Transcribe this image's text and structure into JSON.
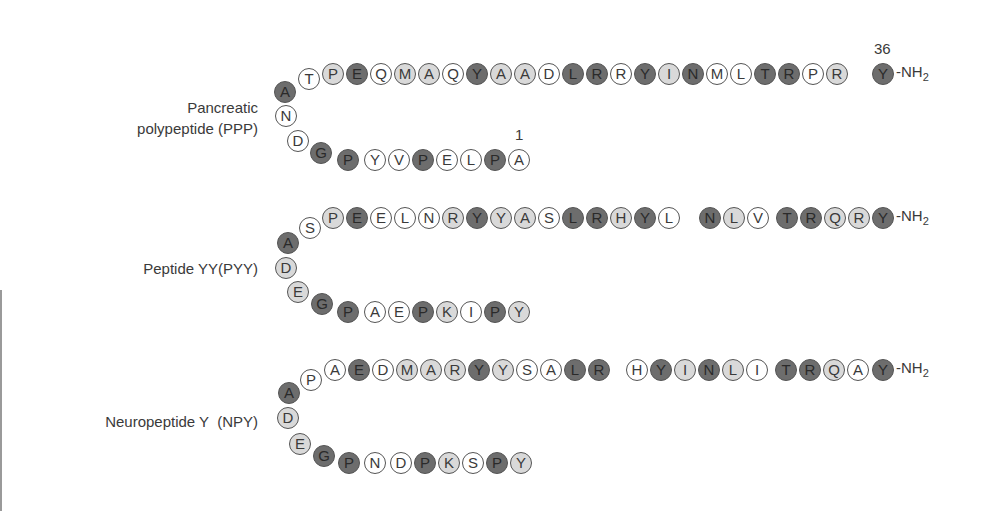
{
  "colors": {
    "dark": "#6d6d6d",
    "light": "#d9d9d9",
    "white": "#ffffff",
    "outline": "#555555"
  },
  "terminal_label": "-NH",
  "terminal_sub": "2",
  "peptides": [
    {
      "name": "Pancreatic polypeptide (PPP)",
      "label_lines": [
        "Pancreatic",
        "polypeptide (PPP)"
      ],
      "label_box": {
        "right": 258,
        "top": 97
      },
      "start_number": "1",
      "end_number": "36",
      "sequence_N_to_C": "APLEPVYPGDNATPEQMAQYAADLRRYINMLTRPRY",
      "residues": [
        {
          "aa": "A",
          "shade": "white",
          "x": 519,
          "y": 160
        },
        {
          "aa": "P",
          "shade": "dark",
          "x": 495,
          "y": 160
        },
        {
          "aa": "L",
          "shade": "white",
          "x": 471,
          "y": 160
        },
        {
          "aa": "E",
          "shade": "white",
          "x": 447,
          "y": 160
        },
        {
          "aa": "P",
          "shade": "dark",
          "x": 423,
          "y": 160
        },
        {
          "aa": "V",
          "shade": "white",
          "x": 399,
          "y": 160
        },
        {
          "aa": "Y",
          "shade": "white",
          "x": 375,
          "y": 160
        },
        {
          "aa": "P",
          "shade": "dark",
          "x": 348,
          "y": 160
        },
        {
          "aa": "G",
          "shade": "dark",
          "x": 321,
          "y": 153
        },
        {
          "aa": "D",
          "shade": "white",
          "x": 298,
          "y": 141
        },
        {
          "aa": "N",
          "shade": "white",
          "x": 286,
          "y": 116
        },
        {
          "aa": "A",
          "shade": "dark",
          "x": 285,
          "y": 92
        },
        {
          "aa": "T",
          "shade": "white",
          "x": 309,
          "y": 79
        },
        {
          "aa": "P",
          "shade": "light",
          "x": 333,
          "y": 74
        },
        {
          "aa": "E",
          "shade": "dark",
          "x": 357,
          "y": 74
        },
        {
          "aa": "Q",
          "shade": "white",
          "x": 381,
          "y": 74
        },
        {
          "aa": "M",
          "shade": "light",
          "x": 405,
          "y": 74
        },
        {
          "aa": "A",
          "shade": "light",
          "x": 429,
          "y": 74
        },
        {
          "aa": "Q",
          "shade": "white",
          "x": 453,
          "y": 74
        },
        {
          "aa": "Y",
          "shade": "dark",
          "x": 477,
          "y": 74
        },
        {
          "aa": "A",
          "shade": "light",
          "x": 501,
          "y": 74
        },
        {
          "aa": "A",
          "shade": "light",
          "x": 525,
          "y": 74
        },
        {
          "aa": "D",
          "shade": "white",
          "x": 549,
          "y": 74
        },
        {
          "aa": "L",
          "shade": "dark",
          "x": 573,
          "y": 74
        },
        {
          "aa": "R",
          "shade": "dark",
          "x": 597,
          "y": 74
        },
        {
          "aa": "R",
          "shade": "white",
          "x": 621,
          "y": 74
        },
        {
          "aa": "Y",
          "shade": "dark",
          "x": 645,
          "y": 74
        },
        {
          "aa": "I",
          "shade": "light",
          "x": 669,
          "y": 74
        },
        {
          "aa": "N",
          "shade": "dark",
          "x": 693,
          "y": 74
        },
        {
          "aa": "M",
          "shade": "white",
          "x": 717,
          "y": 74
        },
        {
          "aa": "L",
          "shade": "white",
          "x": 741,
          "y": 74
        },
        {
          "aa": "T",
          "shade": "dark",
          "x": 765,
          "y": 74
        },
        {
          "aa": "R",
          "shade": "dark",
          "x": 789,
          "y": 74
        },
        {
          "aa": "P",
          "shade": "white",
          "x": 813,
          "y": 74
        },
        {
          "aa": "R",
          "shade": "light",
          "x": 837,
          "y": 74
        },
        {
          "aa": "Y",
          "shade": "dark",
          "x": 883,
          "y": 74
        }
      ]
    },
    {
      "name": "Peptide YY(PYY)",
      "label_lines": [
        "Peptide YY(PYY)"
      ],
      "label_box": {
        "right": 258,
        "top": 258
      },
      "sequence_N_to_C": "YPIKPEAPGEDASPEELNRYYASLRHYLNLVTRQRY",
      "residues": [
        {
          "aa": "Y",
          "shade": "light",
          "x": 519,
          "y": 312
        },
        {
          "aa": "P",
          "shade": "dark",
          "x": 495,
          "y": 312
        },
        {
          "aa": "I",
          "shade": "white",
          "x": 471,
          "y": 312
        },
        {
          "aa": "K",
          "shade": "light",
          "x": 447,
          "y": 312
        },
        {
          "aa": "P",
          "shade": "dark",
          "x": 423,
          "y": 312
        },
        {
          "aa": "E",
          "shade": "white",
          "x": 399,
          "y": 312
        },
        {
          "aa": "A",
          "shade": "white",
          "x": 375,
          "y": 312
        },
        {
          "aa": "P",
          "shade": "dark",
          "x": 348,
          "y": 312
        },
        {
          "aa": "G",
          "shade": "dark",
          "x": 322,
          "y": 304
        },
        {
          "aa": "E",
          "shade": "light",
          "x": 298,
          "y": 292
        },
        {
          "aa": "D",
          "shade": "light",
          "x": 286,
          "y": 268
        },
        {
          "aa": "A",
          "shade": "dark",
          "x": 288,
          "y": 243
        },
        {
          "aa": "S",
          "shade": "white",
          "x": 310,
          "y": 228
        },
        {
          "aa": "P",
          "shade": "light",
          "x": 333,
          "y": 218
        },
        {
          "aa": "E",
          "shade": "dark",
          "x": 357,
          "y": 218
        },
        {
          "aa": "E",
          "shade": "white",
          "x": 381,
          "y": 218
        },
        {
          "aa": "L",
          "shade": "white",
          "x": 405,
          "y": 218
        },
        {
          "aa": "N",
          "shade": "white",
          "x": 429,
          "y": 218
        },
        {
          "aa": "R",
          "shade": "light",
          "x": 453,
          "y": 218
        },
        {
          "aa": "Y",
          "shade": "dark",
          "x": 477,
          "y": 218
        },
        {
          "aa": "Y",
          "shade": "light",
          "x": 501,
          "y": 218
        },
        {
          "aa": "A",
          "shade": "light",
          "x": 525,
          "y": 218
        },
        {
          "aa": "S",
          "shade": "white",
          "x": 549,
          "y": 218
        },
        {
          "aa": "L",
          "shade": "dark",
          "x": 573,
          "y": 218
        },
        {
          "aa": "R",
          "shade": "dark",
          "x": 597,
          "y": 218
        },
        {
          "aa": "H",
          "shade": "light",
          "x": 621,
          "y": 218
        },
        {
          "aa": "Y",
          "shade": "dark",
          "x": 645,
          "y": 218
        },
        {
          "aa": "L",
          "shade": "white",
          "x": 669,
          "y": 218
        },
        {
          "aa": "N",
          "shade": "dark",
          "x": 710,
          "y": 218
        },
        {
          "aa": "L",
          "shade": "light",
          "x": 734,
          "y": 218
        },
        {
          "aa": "V",
          "shade": "white",
          "x": 758,
          "y": 218
        },
        {
          "aa": "T",
          "shade": "dark",
          "x": 787,
          "y": 218
        },
        {
          "aa": "R",
          "shade": "dark",
          "x": 811,
          "y": 218
        },
        {
          "aa": "Q",
          "shade": "light",
          "x": 835,
          "y": 218
        },
        {
          "aa": "R",
          "shade": "light",
          "x": 859,
          "y": 218
        },
        {
          "aa": "Y",
          "shade": "dark",
          "x": 883,
          "y": 218
        }
      ]
    },
    {
      "name": "Neuropeptide Y  (NPY)",
      "label_lines": [
        "Neuropeptide Y  (NPY)"
      ],
      "label_box": {
        "right": 258,
        "top": 411
      },
      "sequence_N_to_C": "YPSKPDNPGEDAPAEDMARYYSALRHYINLITRQAY",
      "residues": [
        {
          "aa": "Y",
          "shade": "light",
          "x": 521,
          "y": 463
        },
        {
          "aa": "P",
          "shade": "dark",
          "x": 497,
          "y": 463
        },
        {
          "aa": "S",
          "shade": "white",
          "x": 473,
          "y": 463
        },
        {
          "aa": "K",
          "shade": "light",
          "x": 449,
          "y": 463
        },
        {
          "aa": "P",
          "shade": "dark",
          "x": 425,
          "y": 463
        },
        {
          "aa": "D",
          "shade": "white",
          "x": 401,
          "y": 463
        },
        {
          "aa": "N",
          "shade": "white",
          "x": 375,
          "y": 463
        },
        {
          "aa": "P",
          "shade": "dark",
          "x": 349,
          "y": 463
        },
        {
          "aa": "G",
          "shade": "dark",
          "x": 324,
          "y": 456
        },
        {
          "aa": "E",
          "shade": "light",
          "x": 300,
          "y": 444
        },
        {
          "aa": "D",
          "shade": "light",
          "x": 288,
          "y": 418
        },
        {
          "aa": "A",
          "shade": "dark",
          "x": 289,
          "y": 393
        },
        {
          "aa": "P",
          "shade": "white",
          "x": 311,
          "y": 380
        },
        {
          "aa": "A",
          "shade": "white",
          "x": 335,
          "y": 370
        },
        {
          "aa": "E",
          "shade": "dark",
          "x": 359,
          "y": 370
        },
        {
          "aa": "D",
          "shade": "white",
          "x": 383,
          "y": 370
        },
        {
          "aa": "M",
          "shade": "light",
          "x": 407,
          "y": 370
        },
        {
          "aa": "A",
          "shade": "light",
          "x": 431,
          "y": 370
        },
        {
          "aa": "R",
          "shade": "light",
          "x": 455,
          "y": 370
        },
        {
          "aa": "Y",
          "shade": "dark",
          "x": 479,
          "y": 370
        },
        {
          "aa": "Y",
          "shade": "light",
          "x": 503,
          "y": 370
        },
        {
          "aa": "S",
          "shade": "white",
          "x": 527,
          "y": 370
        },
        {
          "aa": "A",
          "shade": "white",
          "x": 551,
          "y": 370
        },
        {
          "aa": "L",
          "shade": "dark",
          "x": 575,
          "y": 370
        },
        {
          "aa": "R",
          "shade": "dark",
          "x": 599,
          "y": 370
        },
        {
          "aa": "H",
          "shade": "white",
          "x": 637,
          "y": 370
        },
        {
          "aa": "Y",
          "shade": "dark",
          "x": 661,
          "y": 370
        },
        {
          "aa": "I",
          "shade": "light",
          "x": 685,
          "y": 370
        },
        {
          "aa": "N",
          "shade": "dark",
          "x": 709,
          "y": 370
        },
        {
          "aa": "L",
          "shade": "light",
          "x": 733,
          "y": 370
        },
        {
          "aa": "I",
          "shade": "white",
          "x": 757,
          "y": 370
        },
        {
          "aa": "T",
          "shade": "dark",
          "x": 786,
          "y": 370
        },
        {
          "aa": "R",
          "shade": "dark",
          "x": 810,
          "y": 370
        },
        {
          "aa": "Q",
          "shade": "light",
          "x": 834,
          "y": 370
        },
        {
          "aa": "A",
          "shade": "white",
          "x": 858,
          "y": 370
        },
        {
          "aa": "Y",
          "shade": "dark",
          "x": 883,
          "y": 370
        }
      ]
    }
  ]
}
